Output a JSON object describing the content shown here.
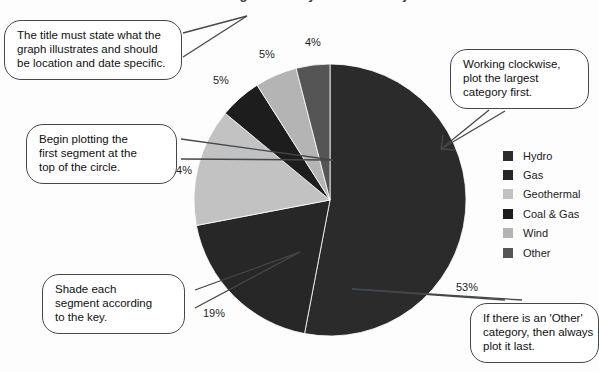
{
  "figure": {
    "title": "Showing Electricity Generation by Source",
    "title_clipped": true
  },
  "chart_data": {
    "type": "pie",
    "title": "Showing Electricity Generation by Source",
    "xlabel": "",
    "ylabel": "",
    "start_angle_deg": 0,
    "direction": "clockwise",
    "legend_position": "right",
    "grid": false,
    "categories": [
      "Hydro",
      "Gas",
      "Geothermal",
      "Coal & Gas",
      "Wind",
      "Other"
    ],
    "values": [
      53,
      19,
      14,
      5,
      5,
      4
    ],
    "unit": "%",
    "data_labels": [
      "53%",
      "19%",
      "14%",
      "5%",
      "5%",
      "4%"
    ],
    "colors": [
      "#2b2b2b",
      "#272727",
      "#c2c2c2",
      "#1d1d1d",
      "#b4b4b4",
      "#555555"
    ],
    "slices": [
      {
        "label": "Hydro",
        "value": 53,
        "display": "53%",
        "color": "#2b2b2b"
      },
      {
        "label": "Gas",
        "value": 19,
        "display": "19%",
        "color": "#272727"
      },
      {
        "label": "Geothermal",
        "value": 14,
        "display": "14%",
        "color": "#c2c2c2"
      },
      {
        "label": "Coal & Gas",
        "value": 5,
        "display": "5%",
        "color": "#1d1d1d"
      },
      {
        "label": "Wind",
        "value": 5,
        "display": "5%",
        "color": "#b4b4b4"
      },
      {
        "label": "Other",
        "value": 4,
        "display": "4%",
        "color": "#555555"
      }
    ]
  },
  "labels": {
    "hydro": "53%",
    "gas": "19%",
    "geothermal": "14%",
    "coal_gas": "5%",
    "wind": "5%",
    "other": "4%"
  },
  "legend": {
    "items": [
      {
        "label": "Hydro",
        "color": "#2b2b2b"
      },
      {
        "label": "Gas",
        "color": "#272727"
      },
      {
        "label": "Geothermal",
        "color": "#c2c2c2"
      },
      {
        "label": "Coal & Gas",
        "color": "#1d1d1d"
      },
      {
        "label": "Wind",
        "color": "#b4b4b4"
      },
      {
        "label": "Other",
        "color": "#555555"
      }
    ]
  },
  "callouts": [
    {
      "id": "title-note",
      "lines": [
        "The title must state what the",
        "graph illustrates and should",
        "be location and date specific."
      ]
    },
    {
      "id": "start-note",
      "lines": [
        "Begin plotting the",
        "first segment at the",
        "top of the circle."
      ]
    },
    {
      "id": "shade-note",
      "lines": [
        "Shade each",
        "segment according",
        "to the key."
      ]
    },
    {
      "id": "clockwise-note",
      "lines": [
        "Working clockwise,",
        "plot the largest",
        "category first."
      ]
    },
    {
      "id": "other-note",
      "lines": [
        "If there is an 'Other'",
        "category, then always",
        "plot it last."
      ]
    }
  ],
  "colors": {
    "ink": "#43484c",
    "text": "#101010",
    "background": "#fdfdfd"
  }
}
